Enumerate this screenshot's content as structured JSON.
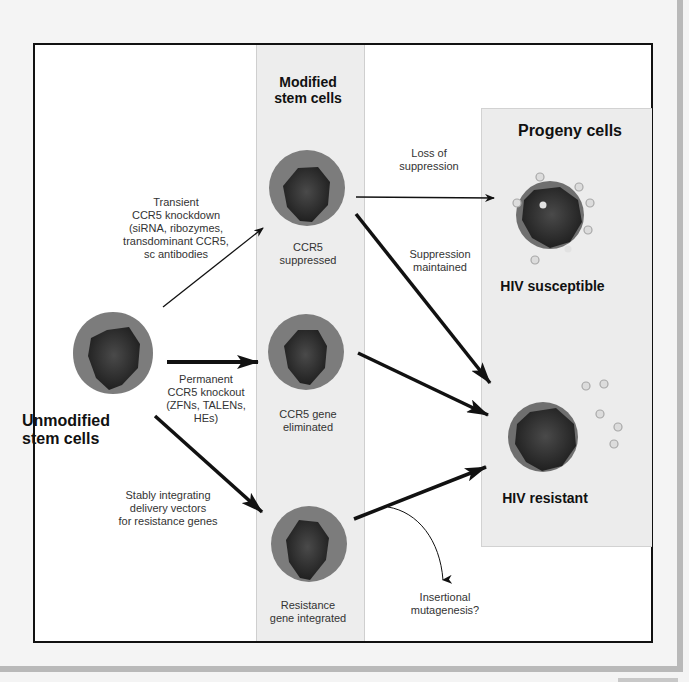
{
  "columns": {
    "unmodified": {
      "title": "Unmodified\nstem cells"
    },
    "modified": {
      "title": "Modified\nstem cells"
    },
    "progeny": {
      "title": "Progeny cells"
    }
  },
  "modified_cells": [
    {
      "label": "CCR5\nsuppressed"
    },
    {
      "label": "CCR5 gene\neliminated"
    },
    {
      "label": "Resistance\ngene integrated"
    }
  ],
  "progeny_cells": [
    {
      "label": "HIV susceptible"
    },
    {
      "label": "HIV resistant"
    }
  ],
  "arrow_labels": {
    "transient": "Transient\nCCR5 knockdown\n(siRNA, ribozymes,\ntransdominant CCR5,\nsc antibodies",
    "permanent": "Permanent\nCCR5 knockout\n(ZFNs, TALENs,\nHEs)",
    "stable": "Stably integrating\ndelivery vectors\nfor resistance genes",
    "loss": "Loss of\nsuppression",
    "maintained": "Suppression\nmaintained",
    "insertional": "Insertional\nmutagenesis?"
  },
  "colors": {
    "cell_outer": "#7c7c7c",
    "cell_nucleus": "#2a2a2a",
    "panel_bg": "#ececec",
    "frame": "#111111",
    "virion": "#b5b5b5"
  }
}
